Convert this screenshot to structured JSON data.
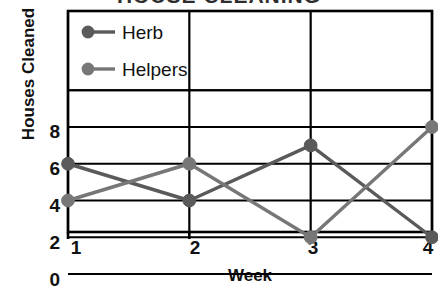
{
  "chart_data": {
    "type": "line",
    "title": "HOUSE CLEANING",
    "xlabel": "Week",
    "ylabel": "Houses Cleaned",
    "categories": [
      "1",
      "2",
      "3",
      "4"
    ],
    "x": [
      1,
      2,
      3,
      4
    ],
    "xlim": [
      1,
      4
    ],
    "ylim": [
      0,
      8
    ],
    "y_ticks": [
      "0",
      "2",
      "4",
      "6",
      "8"
    ],
    "y_tick_values": [
      0,
      2,
      4,
      6,
      8
    ],
    "x_ticks": [
      "1",
      "2",
      "3",
      "4"
    ],
    "grid": true,
    "grid_style": "horizontal and vertical solid black rules",
    "legend_position": "upper-left inside plot area",
    "series": [
      {
        "name": "Herb",
        "values": [
          6,
          4,
          7,
          2
        ],
        "color": "#5a5a5a",
        "marker": "circle"
      },
      {
        "name": "Helpers",
        "values": [
          4,
          6,
          2,
          8
        ],
        "color": "#777777",
        "marker": "circle"
      }
    ]
  },
  "legend": {
    "items": [
      {
        "label": "Herb"
      },
      {
        "label": "Helpers"
      }
    ]
  },
  "axes": {
    "y_label": "Houses Cleaned",
    "x_label": "Week",
    "y_tick_labels": [
      "8",
      "6",
      "4",
      "2",
      "0"
    ],
    "x_tick_labels": [
      "1",
      "2",
      "3",
      "4"
    ]
  },
  "colors": {
    "herb": "#5a5a5a",
    "helpers": "#777777",
    "axis": "#000000",
    "text": "#111111",
    "background": "#ffffff"
  }
}
